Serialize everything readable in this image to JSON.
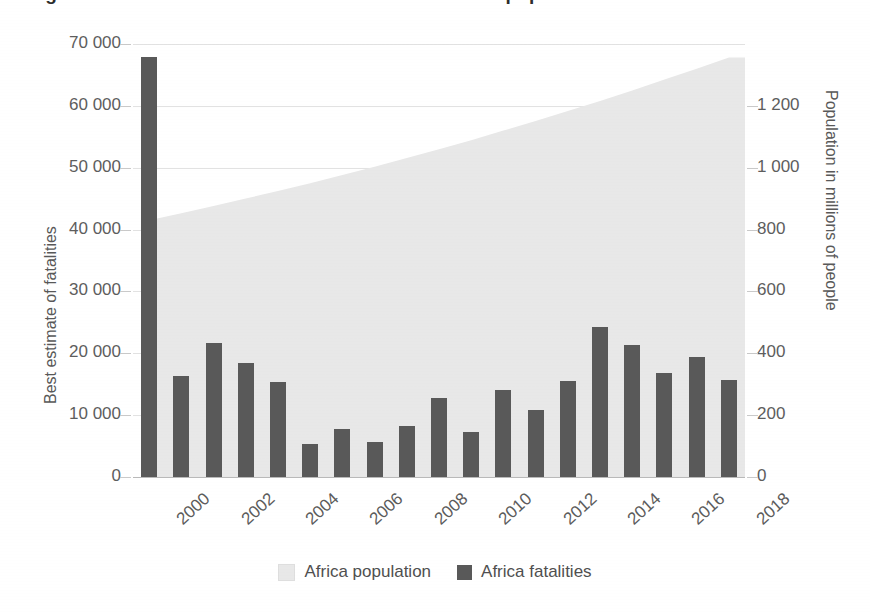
{
  "title": {
    "text": "Figure 1. Deaths from conflict in Africa and Africa's population"
  },
  "axes": {
    "left_title": "Best estimate of fatalities",
    "right_title": "Population in millions of people",
    "left_ticks": [
      "70 000",
      "60 000",
      "50 000",
      "40 000",
      "30 000",
      "20 000",
      "10 000",
      "0"
    ],
    "right_ticks": [
      "1 200",
      "1 000",
      "800",
      "600",
      "400",
      "200",
      "0"
    ],
    "x_ticks": [
      "2000",
      "2002",
      "2004",
      "2006",
      "2008",
      "2010",
      "2012",
      "2014",
      "2016",
      "2018"
    ]
  },
  "legend": {
    "items": [
      {
        "label": "Africa population",
        "color": "#e8e8e8",
        "icon": "square-swatch-icon"
      },
      {
        "label": "Africa fatalities",
        "color": "#595959",
        "icon": "square-swatch-icon"
      }
    ]
  },
  "chart_data": {
    "type": "bar",
    "title": "Deaths from conflict in Africa and Africa's population",
    "xlabel": "",
    "ylabel": "Best estimate of fatalities",
    "y2label": "Population in millions of people",
    "ylim": [
      0,
      70000
    ],
    "y2lim": [
      0,
      1400
    ],
    "grid": true,
    "legend_position": "bottom-center",
    "categories": [
      "2000",
      "2001",
      "2002",
      "2003",
      "2004",
      "2005",
      "2006",
      "2007",
      "2008",
      "2009",
      "2010",
      "2011",
      "2012",
      "2013",
      "2014",
      "2015",
      "2016",
      "2017",
      "2018"
    ],
    "series": [
      {
        "name": "Africa fatalities",
        "type": "bar",
        "axis": "left",
        "color": "#595959",
        "values": [
          67900,
          16400,
          21700,
          18400,
          15300,
          5300,
          7800,
          5700,
          8300,
          12700,
          7200,
          14100,
          10900,
          15500,
          24300,
          21300,
          16800,
          19400,
          15700
        ]
      },
      {
        "name": "Africa population",
        "type": "area",
        "axis": "right",
        "color": "#e8e8e8",
        "units": "millions of people",
        "values": [
          830,
          853,
          876,
          900,
          925,
          950,
          976,
          1003,
          1031,
          1060,
          1089,
          1120,
          1151,
          1183,
          1216,
          1250,
          1285,
          1320,
          1356
        ]
      }
    ]
  }
}
